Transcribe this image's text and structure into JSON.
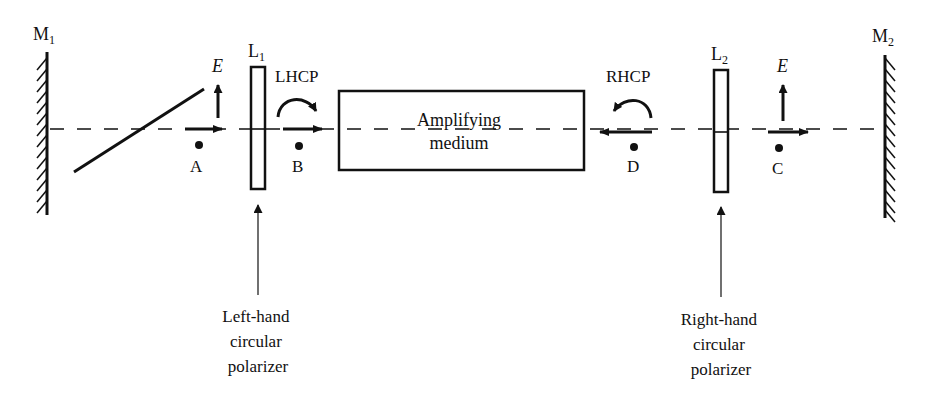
{
  "diagram": {
    "type": "laser cavity with circular polarizers",
    "mirrors": [
      {
        "id": "M1",
        "label": "M",
        "subscript": "1"
      },
      {
        "id": "M2",
        "label": "M",
        "subscript": "2"
      }
    ],
    "polarizers": [
      {
        "id": "L1",
        "label": "L",
        "subscript": "1",
        "caption": [
          "Left-hand",
          "circular",
          "polarizer"
        ]
      },
      {
        "id": "L2",
        "label": "L",
        "subscript": "2",
        "caption": [
          "Right-hand",
          "circular",
          "polarizer"
        ]
      }
    ],
    "medium": {
      "line1": "Amplifying",
      "line2": "medium"
    },
    "points": {
      "A": "A",
      "B": "B",
      "C": "C",
      "D": "D"
    },
    "field_label": "E",
    "polarization_labels": {
      "left": "LHCP",
      "right": "RHCP"
    }
  }
}
